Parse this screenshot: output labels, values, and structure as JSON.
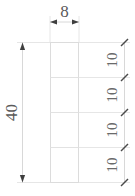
{
  "drawing": {
    "type": "engineering-dimension-drawing",
    "description": "Vertical rectangular bar divided into four equal segments with dimensions",
    "width_dimension": {
      "label": "8",
      "position": "top",
      "orientation": "horizontal"
    },
    "height_dimension": {
      "label": "40",
      "position": "left",
      "orientation": "vertical-rotated"
    },
    "segment_dimensions": {
      "position": "right",
      "orientation": "vertical-rotated",
      "labels": [
        "10",
        "10",
        "10",
        "10"
      ]
    },
    "colors": {
      "background": "#ffffff",
      "object_line": "#e2e2e2",
      "dimension_line": "#d8d8d8",
      "text": "#5a5a5a",
      "tick": "#4a4a4a"
    }
  }
}
